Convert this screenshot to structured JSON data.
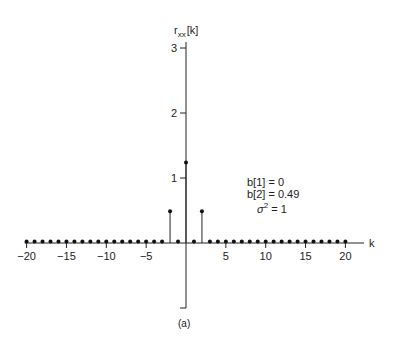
{
  "chart_data": {
    "type": "stem",
    "title": "",
    "ylabel": "r_xx[k]",
    "xlabel": "k",
    "caption": "(a)",
    "x": [
      -20,
      -19,
      -18,
      -17,
      -16,
      -15,
      -14,
      -13,
      -12,
      -11,
      -10,
      -9,
      -8,
      -7,
      -6,
      -5,
      -4,
      -3,
      -2,
      -1,
      0,
      1,
      2,
      3,
      4,
      5,
      6,
      7,
      8,
      9,
      10,
      11,
      12,
      13,
      14,
      15,
      16,
      17,
      18,
      19,
      20
    ],
    "values": [
      0,
      0,
      0,
      0,
      0,
      0,
      0,
      0,
      0,
      0,
      0,
      0,
      0,
      0,
      0,
      0,
      0,
      0,
      0.49,
      0,
      1.24,
      0,
      0.49,
      0,
      0,
      0,
      0,
      0,
      0,
      0,
      0,
      0,
      0,
      0,
      0,
      0,
      0,
      0,
      0,
      0,
      0
    ],
    "xticks": [
      -20,
      -15,
      -10,
      -5,
      5,
      10,
      15,
      20
    ],
    "xtick_labels": [
      "−20",
      "−15",
      "−10",
      "−5",
      "5",
      "10",
      "15",
      "20"
    ],
    "yticks": [
      1,
      2,
      3
    ],
    "ytick_labels": [
      "1",
      "2",
      "3"
    ],
    "ylim": [
      -1,
      3.1
    ],
    "xlim": [
      -20,
      22
    ],
    "grid": false,
    "annotations": [
      "b[1] = 0",
      "b[2] = 0.49",
      "σ² = 1"
    ]
  },
  "annotation": {
    "line1": "b[1] = 0",
    "line2": "b[2] = 0.49",
    "line3_sym": "σ",
    "line3_sup": "2",
    "line3_rest": " = 1"
  },
  "labels": {
    "y_main": "r",
    "y_sub": "xx",
    "y_arg": "[k]",
    "x": "k",
    "caption": "(a)"
  }
}
